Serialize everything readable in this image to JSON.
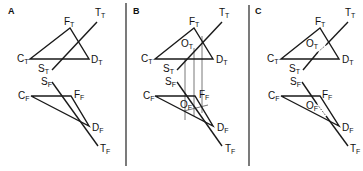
{
  "figure": {
    "panels": [
      {
        "id": "A",
        "label": "A",
        "top_view": {
          "triangle": {
            "C": {
              "name": "C",
              "sub": "T"
            },
            "F": {
              "name": "F",
              "sub": "T"
            },
            "D": {
              "name": "D",
              "sub": "T"
            }
          },
          "line": {
            "S": {
              "name": "S",
              "sub": "T"
            },
            "T": {
              "name": "T",
              "sub": "T"
            }
          }
        },
        "front_view": {
          "triangle": {
            "C": {
              "name": "C",
              "sub": "F"
            },
            "F": {
              "name": "F",
              "sub": "F"
            },
            "D": {
              "name": "D",
              "sub": "F"
            }
          },
          "line": {
            "S": {
              "name": "S",
              "sub": "F"
            },
            "T": {
              "name": "T",
              "sub": "F"
            }
          }
        }
      },
      {
        "id": "B",
        "label": "B",
        "top_view": {
          "triangle": {
            "C": {
              "name": "C",
              "sub": "T"
            },
            "F": {
              "name": "F",
              "sub": "T"
            },
            "D": {
              "name": "D",
              "sub": "T"
            }
          },
          "line": {
            "S": {
              "name": "S",
              "sub": "T"
            },
            "T": {
              "name": "T",
              "sub": "T"
            }
          },
          "piercing_point": {
            "name": "O",
            "sub": "T"
          }
        },
        "front_view": {
          "triangle": {
            "C": {
              "name": "C",
              "sub": "F"
            },
            "F": {
              "name": "F",
              "sub": "F"
            },
            "D": {
              "name": "D",
              "sub": "F"
            }
          },
          "line": {
            "S": {
              "name": "S",
              "sub": "F"
            },
            "T": {
              "name": "T",
              "sub": "F"
            }
          },
          "piercing_point": {
            "name": "O",
            "sub": "F"
          }
        },
        "projection_lines": 3
      },
      {
        "id": "C",
        "label": "C",
        "top_view": {
          "triangle": {
            "C": {
              "name": "C",
              "sub": "T"
            },
            "F": {
              "name": "F",
              "sub": "T"
            },
            "D": {
              "name": "D",
              "sub": "T"
            }
          },
          "line": {
            "S": {
              "name": "S",
              "sub": "T"
            },
            "T": {
              "name": "T",
              "sub": "T"
            }
          },
          "piercing_point": {
            "name": "O",
            "sub": "T"
          }
        },
        "front_view": {
          "triangle": {
            "C": {
              "name": "C",
              "sub": "F"
            },
            "F": {
              "name": "F",
              "sub": "F"
            },
            "D": {
              "name": "D",
              "sub": "F"
            }
          },
          "line": {
            "S": {
              "name": "S",
              "sub": "F"
            },
            "T": {
              "name": "T",
              "sub": "F"
            }
          },
          "piercing_point": {
            "name": "O",
            "sub": "F"
          }
        },
        "hidden_segments": "dashed"
      }
    ]
  }
}
